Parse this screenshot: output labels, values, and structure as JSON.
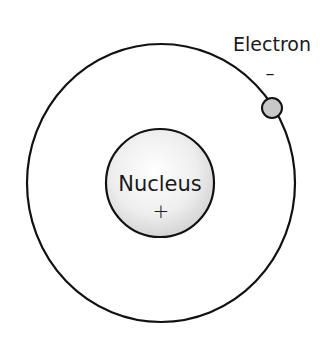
{
  "diagram": {
    "type": "atom-model",
    "orbit": {
      "cx": 161,
      "cy": 183,
      "rx": 134,
      "ry": 139,
      "stroke": "#111111"
    },
    "nucleus": {
      "label": "Nucleus",
      "charge": "+",
      "cx": 160,
      "cy": 183,
      "r": 54,
      "fill_center": "#ffffff",
      "fill_edge": "#cfcfcf"
    },
    "electron": {
      "label": "Electron",
      "charge": "–",
      "cx": 272,
      "cy": 108,
      "r": 10,
      "fill": "#c8c8c8"
    }
  }
}
